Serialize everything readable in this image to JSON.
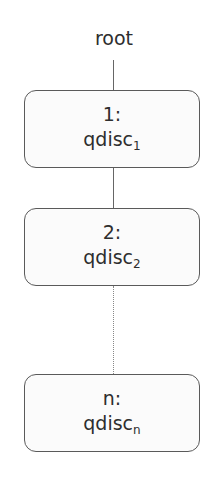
{
  "diagram": {
    "root_label": "root",
    "nodes": [
      {
        "id": "1:",
        "name": "qdisc",
        "sub": "1"
      },
      {
        "id": "2:",
        "name": "qdisc",
        "sub": "2"
      },
      {
        "id": "n:",
        "name": "qdisc",
        "sub": "n"
      }
    ],
    "edges": [
      {
        "from": "root",
        "to": "1:",
        "style": "solid"
      },
      {
        "from": "1:",
        "to": "2:",
        "style": "solid"
      },
      {
        "from": "2:",
        "to": "n:",
        "style": "dotted"
      }
    ],
    "colors": {
      "border": "#5a5a5a",
      "text": "#2e2e2e",
      "line": "#666666"
    }
  }
}
